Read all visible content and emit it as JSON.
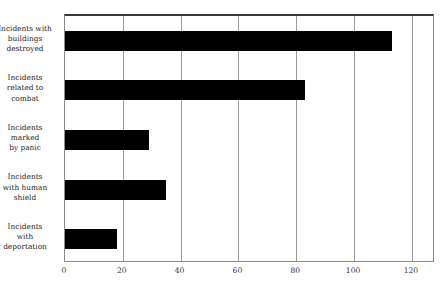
{
  "chart_data": {
    "type": "bar",
    "orientation": "horizontal",
    "title": "",
    "xlabel": "",
    "ylabel": "",
    "categories": [
      "Incidents with buildings destroyed",
      "Incidents related to combat",
      "Incidents marked by panic",
      "Incidents with human shield",
      "Incidents with deportation"
    ],
    "category_lines": [
      [
        "Incidents with",
        "buildings",
        "destroyed"
      ],
      [
        "Incidents",
        "related to",
        "combat"
      ],
      [
        "Incidents",
        "marked",
        "by panic"
      ],
      [
        "Incidents",
        "with human",
        "shield"
      ],
      [
        "Incidents",
        "with",
        "deportation"
      ]
    ],
    "values": [
      113,
      83,
      29,
      35,
      18
    ],
    "xlim": [
      0,
      128
    ],
    "xticks": [
      0,
      20,
      40,
      60,
      80,
      100,
      120
    ],
    "xtick_labels": [
      "0",
      "20",
      "40",
      "60",
      "80",
      "100",
      "120"
    ],
    "grid": true,
    "grid_axis": "x",
    "legend": "none",
    "bar_color": "#000000",
    "grid_color": "#9a9a9a",
    "frame_color": "#8c8c8c",
    "background_color": "#ffffff"
  },
  "caption": ""
}
